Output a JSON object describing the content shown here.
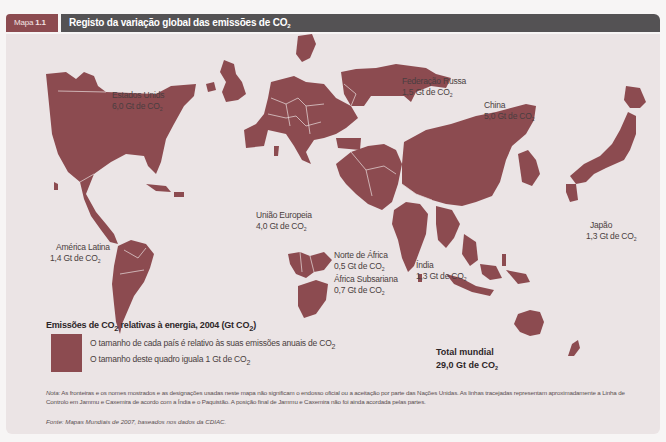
{
  "header": {
    "tab_prefix": "Mapa",
    "tab_number": "1.1",
    "title": "Registo da variação global das emissões de CO",
    "title_sub": "2"
  },
  "map": {
    "fill_color": "#8c4b50",
    "background_color": "#ebe4e5",
    "regions": [
      {
        "name": "Estados Unids",
        "value": "6,0 Gt de CO",
        "sub": "2"
      },
      {
        "name": "Federação Russa",
        "value": "1,5 Gt de CO",
        "sub": "2"
      },
      {
        "name": "China",
        "value": "5,0 Gt de CO",
        "sub": "2"
      },
      {
        "name": "União Europeia",
        "value": "4,0 Gt de CO",
        "sub": "2"
      },
      {
        "name": "América Latina",
        "value": "1,4 Gt de CO",
        "sub": "2"
      },
      {
        "name": "Norte de África",
        "value": "0,5 Gt de CO",
        "sub": "2"
      },
      {
        "name": "África Subsariana",
        "value": "0,7 Gt de CO",
        "sub": "2"
      },
      {
        "name": "Índia",
        "value": "1,3 Gt de CO",
        "sub": "2"
      },
      {
        "name": "Japão",
        "value": "1,3 Gt de CO",
        "sub": "2"
      }
    ]
  },
  "legend": {
    "title_a": "Emissões de CO",
    "title_sub": "2",
    "title_b": " relativas à energia, 2004 (Gt CO",
    "title_c": ")",
    "line1": "O tamanho de cada país é relativo às suas emissões anuais de  CO",
    "line1_sub": "2",
    "line2": "O tamanho deste quadro iguala 1 Gt de CO",
    "line2_sub": "2"
  },
  "total": {
    "label": "Total mundial",
    "value": "29,0 Gt de CO",
    "sub": "2"
  },
  "note": {
    "label": "Nota:",
    "text": " As fronteiras e os nomes mostrados e as designações usadas neste mapa não significam o endosso oficial ou a aceitação por parte das Nações Unidas. As linhas tracejadas representam aproximadamente a Linha de Controlo em Jammu e Caxemira de acordo com a Índia e o Paquistão. A posição final de Jammu e Caxemira não foi ainda acordada pelas partes."
  },
  "source": {
    "text": "Fonte: Mapas Mundiais de 2007, baseados nos dados da CDIAC."
  }
}
